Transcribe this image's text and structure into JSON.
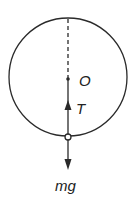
{
  "diagram": {
    "type": "free-body diagram",
    "labels": {
      "center": "O",
      "tension": "T",
      "weight": "mg"
    },
    "colors": {
      "stroke": "#2a2a2a",
      "background": "#ffffff"
    }
  }
}
